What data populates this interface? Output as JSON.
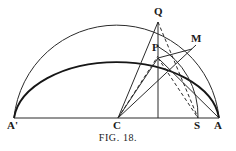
{
  "figure": {
    "caption_prefix": "F",
    "caption_prefix_rest": "IG",
    "caption_suffix": ". 18.",
    "caption_full": "FIG. 18.",
    "background_color": "#ffffff",
    "ink_color": "#1a1a1a"
  },
  "labels": {
    "a_prime": "A'",
    "c": "C",
    "s": "S",
    "a": "A",
    "q": "Q",
    "p": "P",
    "m": "M"
  },
  "geometry": {
    "points": {
      "A_prime": {
        "x": 14,
        "y": 118
      },
      "A": {
        "x": 219,
        "y": 118
      },
      "C": {
        "x": 118,
        "y": 118
      },
      "S": {
        "x": 198,
        "y": 118
      },
      "N": {
        "x": 158,
        "y": 118
      },
      "Q": {
        "x": 158,
        "y": 22
      },
      "P": {
        "x": 158,
        "y": 58
      },
      "M": {
        "x": 192,
        "y": 49
      },
      "O": {
        "x": 116,
        "y": 118
      }
    },
    "outer_semicircle": {
      "cx": 116,
      "cy": 118,
      "r": 103,
      "stroke_width": 1.0
    },
    "inner_ellipse": {
      "cx": 116,
      "cy": 118,
      "rx": 103,
      "ry": 62,
      "stroke_width": 1.8
    },
    "arc_MS": {
      "cx": 118,
      "cy": 118,
      "r": 80
    },
    "baseline": {
      "x1": 14,
      "y1": 118,
      "x2": 219,
      "y2": 118,
      "stroke_width": 1.0
    }
  },
  "lines": {
    "solid": [
      {
        "name": "baseline",
        "from": "A_prime",
        "to": "A"
      },
      {
        "name": "C-to-Q",
        "from": "C",
        "to": "Q"
      },
      {
        "name": "Q-to-N-vertical",
        "from": "Q",
        "to": "N"
      },
      {
        "name": "C-to-A-ray-upper",
        "from": "C",
        "to": "M"
      },
      {
        "name": "P-to-M",
        "from": "P",
        "to": "M"
      },
      {
        "name": "C-to-P-chord",
        "from": "C",
        "to": "P"
      }
    ],
    "dashed": [
      {
        "name": "C-to-P-dashed",
        "from": "C",
        "to": "P"
      },
      {
        "name": "Q-to-S-dashed",
        "from": "Q",
        "to": "S"
      },
      {
        "name": "P-to-S-dashed",
        "from": "P",
        "to": "S"
      }
    ]
  },
  "label_positions": {
    "a_prime": {
      "x": 9,
      "y": 121
    },
    "c": {
      "x": 113,
      "y": 121
    },
    "s": {
      "x": 194,
      "y": 121
    },
    "a": {
      "x": 215,
      "y": 121
    },
    "q": {
      "x": 154,
      "y": 6
    },
    "p": {
      "x": 154,
      "y": 44
    },
    "m": {
      "x": 192,
      "y": 34
    }
  }
}
